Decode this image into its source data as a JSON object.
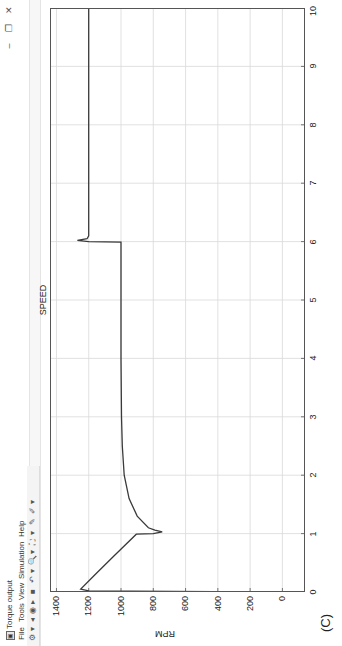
{
  "window": {
    "title": "Torque output",
    "controls": {
      "minimize": "–",
      "restore": "❐",
      "close": "✕"
    }
  },
  "menu": {
    "items": [
      "File",
      "Tools",
      "View",
      "Simulation",
      "Help"
    ]
  },
  "toolbar": {
    "icons": [
      "settings-icon",
      "dropdown-icon",
      "step-back-icon",
      "run-icon",
      "step-forward-icon",
      "stop-icon",
      "highlight-icon",
      "dropdown-icon",
      "zoom-icon",
      "dropdown-icon",
      "fit-icon",
      "dropdown-icon",
      "cursor-measure-icon",
      "style-icon",
      "dropdown-icon"
    ],
    "glyphs": [
      "⚙",
      "▾",
      "◂",
      "◉",
      "▸",
      "■",
      "↶",
      "▾",
      "🔍",
      "▾",
      "⛶",
      "▾",
      "✎",
      "✐",
      "▾"
    ]
  },
  "plot": {
    "title": "SPEED",
    "ylabel": "RPM",
    "panel_label": "(C)",
    "yticks": [
      "1400",
      "1200",
      "1000",
      "800",
      "600",
      "400",
      "200",
      "0"
    ],
    "xticks": [
      "0",
      "1",
      "2",
      "3",
      "4",
      "5",
      "6",
      "7",
      "8",
      "9",
      "10"
    ],
    "line_color": "#3a3a3a",
    "grid_color": "#d9d9d9"
  },
  "chart_data": {
    "type": "line",
    "title": "SPEED",
    "xlabel": "",
    "ylabel": "RPM",
    "xlim": [
      0,
      10
    ],
    "ylim": [
      -140,
      1440
    ],
    "grid": true,
    "x_ticks": [
      0,
      1,
      2,
      3,
      4,
      5,
      6,
      7,
      8,
      9,
      10
    ],
    "y_ticks": [
      0,
      200,
      400,
      600,
      800,
      1000,
      1200,
      1400
    ],
    "series": [
      {
        "name": "Speed",
        "x": [
          0,
          0.02,
          0.05,
          0.3,
          0.6,
          0.99,
          1.0,
          1.03,
          1.06,
          1.1,
          1.3,
          1.6,
          2.0,
          2.5,
          3.0,
          4.0,
          5.0,
          5.99,
          6.0,
          6.02,
          6.05,
          6.1,
          7.0,
          8.0,
          9.0,
          10.0
        ],
        "y": [
          150,
          1200,
          1250,
          1160,
          1050,
          905,
          800,
          745,
          790,
          830,
          900,
          950,
          980,
          992,
          997,
          1000,
          1000,
          1000,
          1200,
          1270,
          1210,
          1200,
          1200,
          1200,
          1200,
          1200
        ]
      }
    ],
    "annotations": [
      "(C)"
    ]
  }
}
